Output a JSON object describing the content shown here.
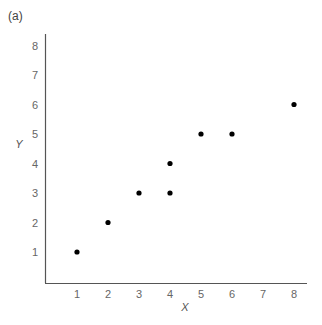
{
  "panel_label": "(a)",
  "chart_data": {
    "type": "scatter",
    "title": "",
    "xlabel": "X",
    "ylabel": "Y",
    "x_tick_labels": [
      "1",
      "2",
      "3",
      "4",
      "5",
      "6",
      "7",
      "8"
    ],
    "y_tick_labels": [
      "1",
      "2",
      "3",
      "4",
      "5",
      "6",
      "7",
      "8"
    ],
    "grid": false,
    "legend": null,
    "points": [
      {
        "x": 1,
        "y": 1
      },
      {
        "x": 2,
        "y": 2
      },
      {
        "x": 3,
        "y": 3
      },
      {
        "x": 4,
        "y": 3
      },
      {
        "x": 4,
        "y": 4
      },
      {
        "x": 5,
        "y": 5
      },
      {
        "x": 6,
        "y": 5
      },
      {
        "x": 8,
        "y": 6
      }
    ],
    "xlim": [
      0,
      8.4
    ],
    "ylim": [
      0,
      8.4
    ],
    "marker_color": "#000000",
    "axis_color": "#555555"
  }
}
